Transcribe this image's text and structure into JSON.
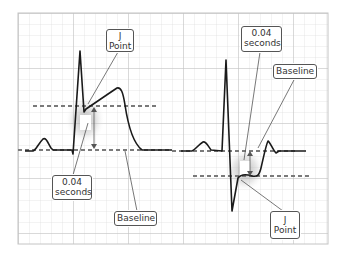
{
  "diagram": {
    "colors": {
      "grid_minor": "#d9d9d9",
      "grid_major": "#bdbdbd",
      "trace": "#1a1a1a",
      "dashed_line": "#7a7a7a",
      "label_border": "#555555",
      "leader_line": "#555555"
    },
    "panels": [
      {
        "name": "st-elevation",
        "labels": {
          "j_point": [
            "J",
            "Point"
          ],
          "interval": [
            "0.04",
            "seconds"
          ],
          "baseline": "Baseline"
        }
      },
      {
        "name": "st-depression",
        "labels": {
          "interval": [
            "0.04",
            "seconds"
          ],
          "baseline": "Baseline",
          "j_point": [
            "J",
            "Point"
          ]
        }
      }
    ]
  }
}
